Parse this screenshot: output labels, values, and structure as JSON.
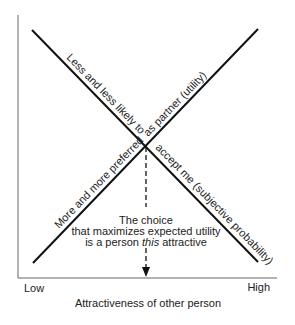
{
  "diagram": {
    "type": "crossing-lines",
    "axes": {
      "x_label": "Attractiveness of other person",
      "x_low": "Low",
      "x_high": "High"
    },
    "lines": [
      {
        "name": "utility-line",
        "direction": "descending",
        "label": "Less and less likely to accept me (subjective probability)",
        "label_upper": "Less and less likely to",
        "label_lower": "accept me (subjective probability)"
      },
      {
        "name": "probability-line",
        "direction": "ascending",
        "label": "More and more preferred as partner (utility)",
        "label_lower": "More and more preferred",
        "label_upper": "as partner (utility)"
      }
    ],
    "annotation": {
      "line1": "The choice",
      "line2": "that maximizes expected utility",
      "line3_prefix": "is a person ",
      "line3_emphasis": "this",
      "line3_suffix": " attractive"
    },
    "colors": {
      "line": "#111111",
      "axis": "#555555",
      "text": "#222222",
      "background": "#ffffff"
    }
  }
}
